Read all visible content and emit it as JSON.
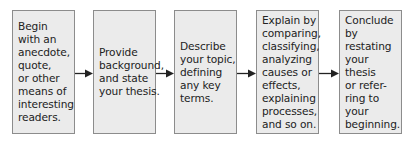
{
  "diagram": {
    "type": "flowchart",
    "direction": "left-to-right",
    "colors": {
      "box_fill": "#ebebeb",
      "box_border": "#8c8c8c",
      "text": "#222222",
      "arrow": "#222222"
    },
    "steps": [
      {
        "label": "Begin\nwith an\nanecdote,\nquote,\nor other\nmeans of\ninteresting\nreaders."
      },
      {
        "label": "Provide\nbackground,\nand state\nyour thesis."
      },
      {
        "label": "Describe\nyour topic,\ndefining\nany key\nterms."
      },
      {
        "label": "Explain by\ncomparing,\nclassifying,\nanalyzing\ncauses or\neffects,\nexplaining\nprocesses,\nand so on."
      },
      {
        "label": "Conclude\nby restating\nyour thesis\nor refer-\nring to your\nbeginning."
      }
    ],
    "connectors": [
      {
        "from": 0,
        "to": 1,
        "icon": "arrow-right-icon"
      },
      {
        "from": 1,
        "to": 2,
        "icon": "arrow-right-icon"
      },
      {
        "from": 2,
        "to": 3,
        "icon": "arrow-right-icon"
      },
      {
        "from": 3,
        "to": 4,
        "icon": "arrow-right-icon"
      }
    ]
  }
}
